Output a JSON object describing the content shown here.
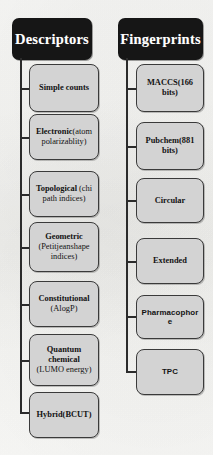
{
  "figure": {
    "type": "diagram",
    "layout": "two parallel vertical trees",
    "background_color": "#fdfdfb",
    "root_fill": "#161616",
    "root_text_color": "#ffffff",
    "node_fill": "#d3d3d3",
    "node_border_color": "#3a3a3a",
    "connector_color": "#2b2b2b"
  },
  "trees": [
    {
      "id": "descriptors",
      "root_label": "Descriptors",
      "nodes": [
        {
          "bold": "Simple counts",
          "regular": ""
        },
        {
          "bold": "Electronic",
          "regular": "(atom polarizablity)"
        },
        {
          "bold": "Topological",
          "regular": " (chi path indices)"
        },
        {
          "bold": "Geometric",
          "regular": "(Petitjeanshape indices)",
          "stacked": true
        },
        {
          "bold": "Constitutional",
          "regular": "(AlogP)",
          "stacked": true
        },
        {
          "bold": "Quantum chemical",
          "regular": "(LUMO energy)",
          "stacked": true
        },
        {
          "bold": "Hybrid(BCUT)",
          "regular": ""
        }
      ]
    },
    {
      "id": "fingerprints",
      "root_label": "Fingerprints",
      "nodes": [
        {
          "bold": "MACCS(166 bits)",
          "regular": ""
        },
        {
          "bold": "Pubchem(881 bits)",
          "regular": ""
        },
        {
          "bold": "Circular",
          "regular": ""
        },
        {
          "bold": "Extended",
          "regular": ""
        },
        {
          "bold": "Pharmacophore",
          "regular": "",
          "sans": true
        },
        {
          "bold": "TPC",
          "regular": "",
          "sans": true
        }
      ]
    }
  ]
}
